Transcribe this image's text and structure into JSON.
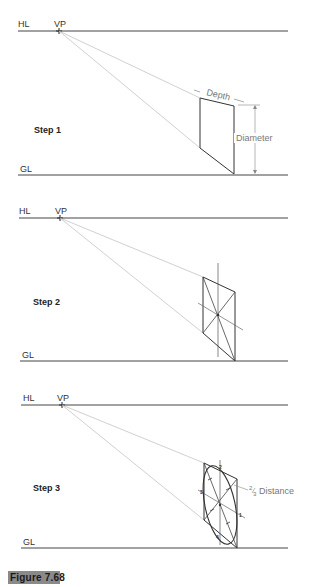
{
  "figure": {
    "caption": "Figure 7.68",
    "badge_color": "#8a8a8a"
  },
  "labels": {
    "horizon_line": "HL",
    "vanishing_point": "VP",
    "ground_line": "GL"
  },
  "panels": [
    {
      "step_label": "Step 1",
      "dimensions": {
        "depth": "Depth",
        "diameter": "Diameter"
      }
    },
    {
      "step_label": "Step 2"
    },
    {
      "step_label": "Step 3",
      "annotation": "Distance",
      "fraction_num": "2",
      "fraction_den": "3",
      "point_marks": [
        "1",
        "2",
        "3",
        "4"
      ]
    }
  ],
  "colors": {
    "line": "#444444",
    "construction": "#bbbbbb",
    "dimension": "#888888"
  }
}
